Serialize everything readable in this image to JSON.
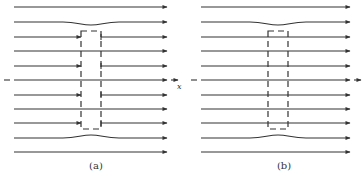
{
  "figure": {
    "panels": [
      {
        "id": "a",
        "caption": "(a)",
        "x_start": 14,
        "x_end": 167,
        "box": {
          "x": 81,
          "y": 31,
          "width": 20,
          "height": 98
        },
        "streamlines": [
          {
            "y": 7,
            "type": "straight"
          },
          {
            "y": 22,
            "type": "dip"
          },
          {
            "y": 37,
            "type": "interrupted"
          },
          {
            "y": 51,
            "type": "straight"
          },
          {
            "y": 66,
            "type": "interrupted"
          },
          {
            "y": 80,
            "type": "straight",
            "axis": true
          },
          {
            "y": 95,
            "type": "interrupted"
          },
          {
            "y": 109,
            "type": "straight"
          },
          {
            "y": 123,
            "type": "interrupted"
          },
          {
            "y": 138,
            "type": "bump"
          },
          {
            "y": 152,
            "type": "straight"
          }
        ],
        "axis_label": "x"
      },
      {
        "id": "b",
        "caption": "(b)",
        "x_start": 201,
        "x_end": 350,
        "box": {
          "x": 268,
          "y": 31,
          "width": 20,
          "height": 98
        },
        "streamlines": [
          {
            "y": 7,
            "type": "straight"
          },
          {
            "y": 22,
            "type": "dip"
          },
          {
            "y": 37,
            "type": "straight"
          },
          {
            "y": 51,
            "type": "straight"
          },
          {
            "y": 66,
            "type": "straight"
          },
          {
            "y": 80,
            "type": "straight",
            "axis": true
          },
          {
            "y": 95,
            "type": "straight"
          },
          {
            "y": 109,
            "type": "straight"
          },
          {
            "y": 123,
            "type": "straight"
          },
          {
            "y": 138,
            "type": "bump"
          },
          {
            "y": 152,
            "type": "straight"
          }
        ]
      }
    ],
    "line_color": "#333333"
  }
}
